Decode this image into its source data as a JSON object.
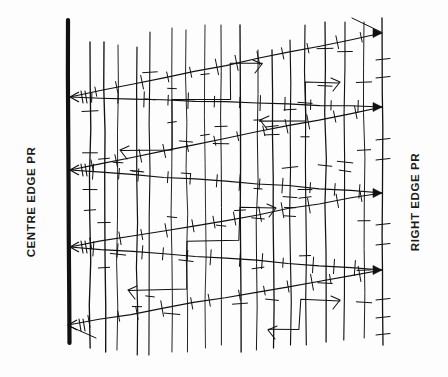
{
  "figure": {
    "background_color": "#fdfdfd",
    "ink_color": "#111111",
    "width": 448,
    "height": 377
  },
  "labels": {
    "left": "CENTRE EDGE PR",
    "right": "RIGHT EDGE PR"
  },
  "chart_data": {
    "type": "line",
    "xlabel": "",
    "ylabel": "",
    "grid": true,
    "legend_position": "none",
    "axis_ranges": {
      "x": [
        68,
        382
      ],
      "y": [
        18,
        345
      ]
    },
    "annotations": [
      {
        "text": "CENTRE EDGE PR",
        "x": 22,
        "y": 196,
        "rotation": -90
      },
      {
        "text": "RIGHT EDGE PR",
        "x": 415,
        "y": 196,
        "rotation": -90
      }
    ],
    "reference_lines": [
      {
        "name": "centre-edge-pr",
        "x": 68,
        "y0": 20,
        "y1": 343,
        "width": 4.2,
        "style": "heavy"
      },
      {
        "name": "right-edge-pr",
        "x": 382,
        "y0": 18,
        "y1": 345,
        "width": 1.3,
        "style": "light"
      }
    ],
    "convergence_nodes": [
      {
        "name": "node-right-1",
        "x": 382,
        "y": 33,
        "side": "right"
      },
      {
        "name": "node-right-2",
        "x": 382,
        "y": 107,
        "side": "right"
      },
      {
        "name": "node-right-3",
        "x": 382,
        "y": 193,
        "side": "right"
      },
      {
        "name": "node-right-4",
        "x": 382,
        "y": 270,
        "side": "right"
      },
      {
        "name": "node-left-1",
        "x": 70,
        "y": 97,
        "side": "left"
      },
      {
        "name": "node-left-2",
        "x": 70,
        "y": 170,
        "side": "left"
      },
      {
        "name": "node-left-3",
        "x": 70,
        "y": 247,
        "side": "left"
      },
      {
        "name": "node-left-4",
        "x": 68,
        "y": 325,
        "side": "left"
      }
    ],
    "series": [
      {
        "name": "wedge-1-upper",
        "x": [
          70,
          382
        ],
        "values": [
          97,
          33
        ]
      },
      {
        "name": "wedge-1-lower",
        "x": [
          70,
          382
        ],
        "values": [
          97,
          107
        ]
      },
      {
        "name": "wedge-2-upper",
        "x": [
          70,
          382
        ],
        "values": [
          170,
          107
        ]
      },
      {
        "name": "wedge-2-lower",
        "x": [
          70,
          382
        ],
        "values": [
          170,
          193
        ]
      },
      {
        "name": "wedge-3-upper",
        "x": [
          70,
          382
        ],
        "values": [
          247,
          193
        ]
      },
      {
        "name": "wedge-3-lower",
        "x": [
          70,
          382
        ],
        "values": [
          247,
          270
        ]
      },
      {
        "name": "wedge-4-upper",
        "x": [
          68,
          382
        ],
        "values": [
          325,
          270
        ]
      }
    ],
    "vertical_gridlines": [
      {
        "x": 90,
        "y0": 42,
        "y1": 348
      },
      {
        "x": 104,
        "y0": 42,
        "y1": 352
      },
      {
        "x": 118,
        "y0": 45,
        "y1": 350
      },
      {
        "x": 137,
        "y0": 47,
        "y1": 355
      },
      {
        "x": 150,
        "y0": 32,
        "y1": 355
      },
      {
        "x": 172,
        "y0": 28,
        "y1": 352
      },
      {
        "x": 186,
        "y0": 30,
        "y1": 352
      },
      {
        "x": 205,
        "y0": 25,
        "y1": 348
      },
      {
        "x": 221,
        "y0": 25,
        "y1": 345
      },
      {
        "x": 240,
        "y0": 25,
        "y1": 352
      },
      {
        "x": 258,
        "y0": 50,
        "y1": 350
      },
      {
        "x": 272,
        "y0": 50,
        "y1": 348
      },
      {
        "x": 290,
        "y0": 40,
        "y1": 345
      },
      {
        "x": 305,
        "y0": 25,
        "y1": 345
      },
      {
        "x": 325,
        "y0": 22,
        "y1": 342
      },
      {
        "x": 345,
        "y0": 22,
        "y1": 340
      },
      {
        "x": 364,
        "y0": 22,
        "y1": 338
      }
    ],
    "bracket_paths": [
      {
        "name": "bracket-a",
        "points": [
          [
            120,
            150
          ],
          [
            172,
            150
          ],
          [
            172,
            100
          ],
          [
            230,
            100
          ],
          [
            230,
            64
          ],
          [
            262,
            64
          ]
        ]
      },
      {
        "name": "bracket-b",
        "points": [
          [
            128,
            290
          ],
          [
            186,
            290
          ],
          [
            186,
            240
          ],
          [
            240,
            240
          ],
          [
            240,
            208
          ],
          [
            276,
            208
          ]
        ]
      },
      {
        "name": "bracket-c",
        "points": [
          [
            260,
            120
          ],
          [
            305,
            120
          ],
          [
            305,
            82
          ],
          [
            340,
            82
          ]
        ]
      },
      {
        "name": "bracket-d",
        "points": [
          [
            268,
            330
          ],
          [
            300,
            330
          ],
          [
            300,
            300
          ],
          [
            340,
            300
          ]
        ]
      }
    ],
    "tick_count_estimate": 190
  }
}
